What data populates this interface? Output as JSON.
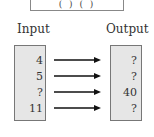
{
  "function_machine": {
    "rule_text": "( ) ( )"
  },
  "headers": {
    "input": "Input",
    "output": "Output"
  },
  "rows": [
    {
      "input": "4",
      "output": "?"
    },
    {
      "input": "5",
      "output": "?"
    },
    {
      "input": "?",
      "output": "40"
    },
    {
      "input": "11",
      "output": "?"
    }
  ],
  "colors": {
    "box_fill": "#e6e6e6",
    "border": "#777777",
    "arrow": "#111111"
  }
}
